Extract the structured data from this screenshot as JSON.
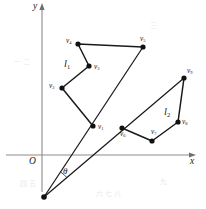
{
  "figure": {
    "background_color": "#ffffff",
    "stroke_color": "#1a1a1a",
    "axis_color": "#8c8c8c"
  },
  "axes": {
    "x_label": "x",
    "y_label": "y",
    "origin_label": "O",
    "x_axis": {
      "y": 155,
      "x_start": 6,
      "x_end": 196,
      "arrow": true
    },
    "y_axis": {
      "x": 42,
      "y_start": 192,
      "y_end": 3,
      "arrow": true
    }
  },
  "angle": {
    "label": "θ",
    "vertex": {
      "x": 44,
      "y": 197
    },
    "label_pos": {
      "x": 63,
      "y": 167
    }
  },
  "chains": [
    {
      "name": "l1",
      "label": "l",
      "label_sub": "1",
      "label_pos": {
        "x": 64,
        "y": 59
      },
      "vertices": [
        {
          "id": "v1",
          "label": "v",
          "sub": "1",
          "x": 93,
          "y": 126,
          "label_dx": 5,
          "label_dy": 2
        },
        {
          "id": "v2",
          "label": "v",
          "sub": "2",
          "x": 62,
          "y": 88,
          "label_dx": -14,
          "label_dy": -1
        },
        {
          "id": "v3",
          "label": "v",
          "sub": "3",
          "x": 89,
          "y": 66,
          "label_dx": 5,
          "label_dy": 2
        },
        {
          "id": "v4",
          "label": "v",
          "sub": "4",
          "x": 78,
          "y": 44,
          "label_dx": -13,
          "label_dy": -2
        },
        {
          "id": "v5",
          "label": "v",
          "sub": "5",
          "x": 143,
          "y": 47,
          "label_dx": -4,
          "label_dy": -7
        }
      ]
    },
    {
      "name": "l2",
      "label": "l",
      "label_sub": "2",
      "label_pos": {
        "x": 164,
        "y": 107
      },
      "vertices": [
        {
          "id": "v6",
          "label": "v",
          "sub": "6",
          "x": 122,
          "y": 128,
          "label_dx": -3,
          "label_dy": 7
        },
        {
          "id": "v7",
          "label": "v",
          "sub": "7",
          "x": 152,
          "y": 141,
          "label_dx": -2,
          "label_dy": -8
        },
        {
          "id": "v8",
          "label": "v",
          "sub": "8",
          "x": 178,
          "y": 122,
          "label_dx": 4,
          "label_dy": 1
        },
        {
          "id": "v9",
          "label": "v",
          "sub": "9",
          "x": 184,
          "y": 78,
          "label_dx": 3,
          "label_dy": -6
        }
      ]
    }
  ],
  "rays": [
    {
      "name": "ray-to-l1",
      "from": {
        "x": 44,
        "y": 197
      },
      "to": {
        "x": 143,
        "y": 47
      }
    },
    {
      "name": "ray-to-l2",
      "from": {
        "x": 44,
        "y": 197
      },
      "to": {
        "x": 184,
        "y": 78
      }
    }
  ],
  "bleed_marks": [
    {
      "text": "一 二",
      "x": 14,
      "y": 56
    },
    {
      "text": "三",
      "x": 150,
      "y": 20
    },
    {
      "text": "四 五",
      "x": 20,
      "y": 178
    },
    {
      "text": "六 七 八",
      "x": 96,
      "y": 188
    },
    {
      "text": "九",
      "x": 160,
      "y": 176
    }
  ]
}
